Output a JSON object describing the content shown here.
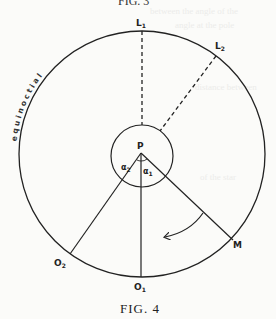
{
  "figure": {
    "top_caption": "FIG. 3",
    "caption": "FIG. 4",
    "circle_label": "equinoctial",
    "points": {
      "L1": {
        "main": "L",
        "sub": "1"
      },
      "L2": {
        "main": "L",
        "sub": "2"
      },
      "P": {
        "main": "P"
      },
      "M": {
        "main": "M"
      },
      "O1": {
        "main": "O",
        "sub": "1"
      },
      "O2": {
        "main": "O",
        "sub": "2"
      }
    },
    "angles": {
      "a1": {
        "main": "α",
        "sub": "1"
      },
      "a2": {
        "main": "α",
        "sub": "2"
      }
    },
    "colors": {
      "ink": "#222222",
      "paper": "#fbfbf9"
    }
  }
}
